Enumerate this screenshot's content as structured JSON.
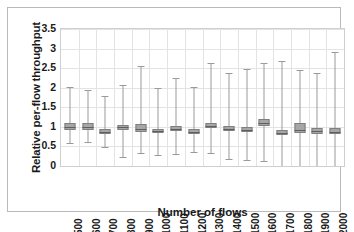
{
  "chart_data": {
    "type": "box",
    "title": "",
    "xlabel": "Number of flows",
    "ylabel": "Relative per-flow throughput",
    "ylim": [
      0,
      3.5
    ],
    "ytick_labels": [
      "0",
      "0.5",
      "1",
      "1.5",
      "2",
      "2.5",
      "3",
      "3.5"
    ],
    "ytick_values": [
      0,
      0.5,
      1,
      1.5,
      2,
      2.5,
      3,
      3.5
    ],
    "grid": true,
    "legend": "none",
    "categories": [
      "500",
      "600",
      "700",
      "800",
      "900",
      "1000",
      "1100",
      "1200",
      "1300",
      "1400",
      "1500",
      "1600",
      "1700",
      "1800",
      "1900",
      "2000"
    ],
    "boxes": [
      {
        "category": "500",
        "whisker_low": 0.58,
        "q1": 0.92,
        "median": 1.0,
        "q3": 1.09,
        "whisker_high": 2.03
      },
      {
        "category": "600",
        "whisker_low": 0.61,
        "q1": 0.92,
        "median": 1.0,
        "q3": 1.09,
        "whisker_high": 1.94
      },
      {
        "category": "700",
        "whisker_low": 0.49,
        "q1": 0.83,
        "median": 0.88,
        "q3": 0.94,
        "whisker_high": 1.8
      },
      {
        "category": "800",
        "whisker_low": 0.24,
        "q1": 0.91,
        "median": 0.99,
        "q3": 1.06,
        "whisker_high": 2.07
      },
      {
        "category": "900",
        "whisker_low": 0.34,
        "q1": 0.88,
        "median": 0.94,
        "q3": 1.07,
        "whisker_high": 2.56
      },
      {
        "category": "1000",
        "whisker_low": 0.29,
        "q1": 0.85,
        "median": 0.89,
        "q3": 0.95,
        "whisker_high": 1.98
      },
      {
        "category": "1100",
        "whisker_low": 0.31,
        "q1": 0.9,
        "median": 0.95,
        "q3": 1.03,
        "whisker_high": 2.25
      },
      {
        "category": "1200",
        "whisker_low": 0.35,
        "q1": 0.82,
        "median": 0.87,
        "q3": 0.94,
        "whisker_high": 2.03
      },
      {
        "category": "1300",
        "whisker_low": 0.32,
        "q1": 0.96,
        "median": 1.02,
        "q3": 1.11,
        "whisker_high": 2.64
      },
      {
        "category": "1400",
        "whisker_low": 0.17,
        "q1": 0.89,
        "median": 0.94,
        "q3": 1.02,
        "whisker_high": 2.38
      },
      {
        "category": "1500",
        "whisker_low": 0.16,
        "q1": 0.88,
        "median": 0.92,
        "q3": 1.0,
        "whisker_high": 2.48
      },
      {
        "category": "1600",
        "whisker_low": 0.13,
        "q1": 1.03,
        "median": 1.1,
        "q3": 1.21,
        "whisker_high": 2.64
      },
      {
        "category": "1700",
        "whisker_low": 0.0,
        "q1": 0.79,
        "median": 0.85,
        "q3": 0.93,
        "whisker_high": 2.67
      },
      {
        "category": "1800",
        "whisker_low": 0.0,
        "q1": 0.85,
        "median": 0.93,
        "q3": 1.1,
        "whisker_high": 2.44
      },
      {
        "category": "1900",
        "whisker_low": 0.0,
        "q1": 0.83,
        "median": 0.89,
        "q3": 0.97,
        "whisker_high": 2.37
      },
      {
        "category": "2000",
        "whisker_low": 0.0,
        "q1": 0.81,
        "median": 0.87,
        "q3": 0.97,
        "whisker_high": 2.92
      }
    ],
    "colors": {
      "box_fill": "#a6a6a6",
      "box_border": "#7f7f7f",
      "whisker": "#9a9a9a",
      "median": "#5e5e5e",
      "grid": "#e3e3e3",
      "plot_border": "#cfcfcf",
      "frame_border": "#b9b9b9",
      "text": "#1a1a1a",
      "background": "#ffffff"
    }
  }
}
